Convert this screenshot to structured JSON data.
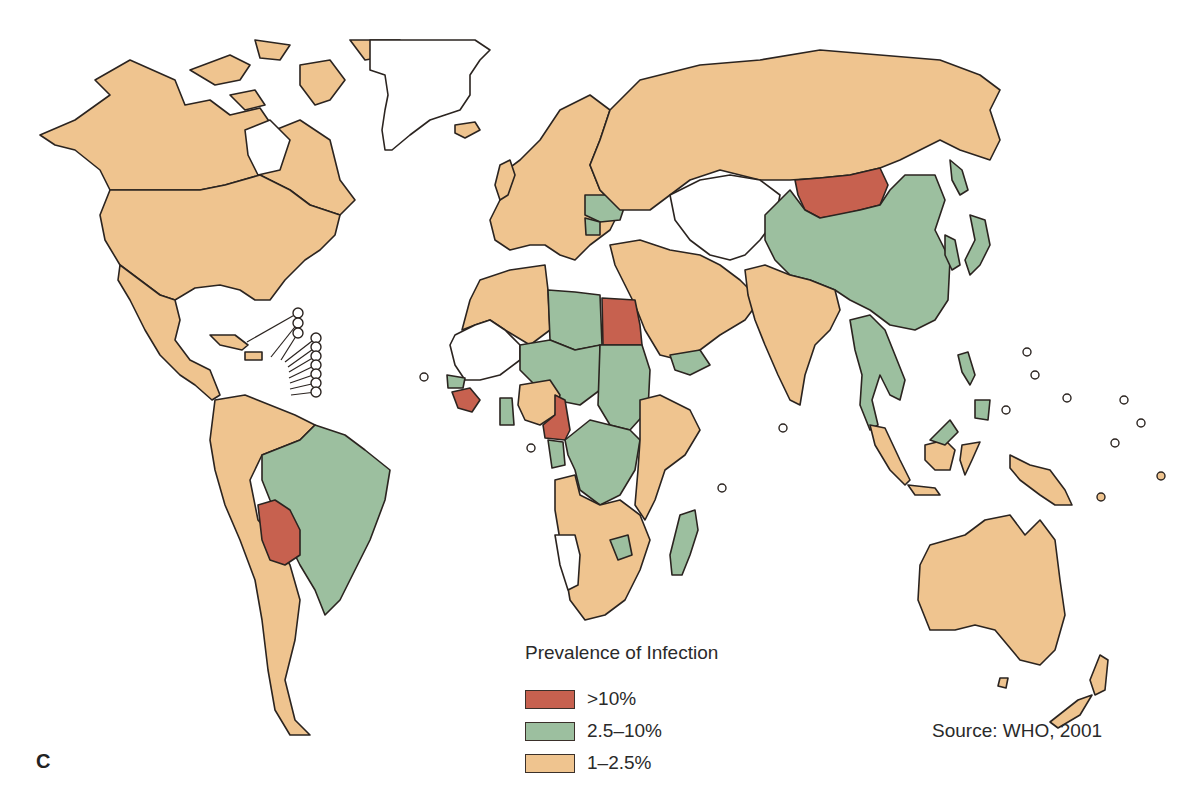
{
  "figure": {
    "panel_letter": "C",
    "type": "choropleth world map",
    "source": "Source: WHO, 2001"
  },
  "legend": {
    "title": "Prevalence of Infection",
    "items": [
      {
        "label": ">10%",
        "color": "#c7614f",
        "class": "high"
      },
      {
        "label": "2.5–10%",
        "color": "#9cbf9f",
        "class": "mid"
      },
      {
        "label": "1–2.5%",
        "color": "#efc48f",
        "class": "low"
      }
    ]
  },
  "colors": {
    "no_data": "#ffffff",
    "border": "#2b2420",
    "background": "#ffffff"
  },
  "regions": {
    "high": [
      "Mongolia",
      "Egypt",
      "Bolivia",
      "Cameroon",
      "Guinea"
    ],
    "mid": [
      "China",
      "Brazil",
      "Libya",
      "Chad",
      "Sudan",
      "Niger",
      "DR Congo",
      "Madagascar",
      "Ukraine",
      "Romania",
      "Japan",
      "Vietnam",
      "Thailand",
      "Philippines",
      "Malaysia",
      "Senegal",
      "Ghana",
      "Gabon",
      "Zimbabwe",
      "Yemen",
      "Korea"
    ],
    "low": [
      "Canada",
      "USA",
      "Mexico",
      "Russia",
      "Australia",
      "India",
      "Argentina",
      "Western Europe",
      "Middle East",
      "Indonesia",
      "Papua New Guinea",
      "New Zealand",
      "Southern Africa",
      "East Africa",
      "Algeria",
      "Nigeria"
    ],
    "no_data": [
      "Greenland",
      "Central Asia",
      "Mauritania",
      "Mali",
      "Namibia",
      "Ivory Coast"
    ]
  }
}
